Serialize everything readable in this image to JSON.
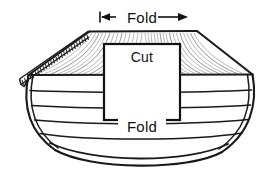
{
  "figure": {
    "type": "line-drawing",
    "background_color": "#ffffff",
    "ink_color": "#1a1a1a"
  },
  "labels": {
    "fold_top": "Fold",
    "cut": "Cut",
    "fold_bottom": "Fold"
  },
  "annotations": {
    "top_dimension": {
      "label": "Fold",
      "style": "double-headed-arrow",
      "left_arrow": "arrow-left",
      "right_arrow": "arrow-right",
      "span_start_x": 100,
      "span_end_x": 188
    },
    "bottom_fold": {
      "label": "Fold",
      "style": "leader-lines-both-sides"
    },
    "cut_region": {
      "label": "Cut",
      "style": "solid-rectangle-outline",
      "x": 104,
      "y": 44,
      "width": 76,
      "height": 76
    }
  },
  "parts": {
    "rail_hatch_count": 26,
    "hull_plank_count": 4,
    "keel_curve_count": 3,
    "deck_ray_count_left": 14,
    "deck_ray_count_right": 16
  },
  "colors": {
    "ink": "#1a1a1a",
    "light_ray": "#7d7d7d",
    "dashed_fold": "#9a9a9a",
    "paper": "#ffffff"
  }
}
